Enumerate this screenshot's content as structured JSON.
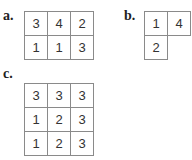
{
  "panels": [
    {
      "label": "a.",
      "rows": [
        [
          "3",
          "4",
          "2"
        ],
        [
          "1",
          "1",
          "3"
        ]
      ]
    },
    {
      "label": "b.",
      "rows": [
        [
          "1",
          "4"
        ],
        [
          "2",
          ""
        ]
      ]
    },
    {
      "label": "c.",
      "rows": [
        [
          "3",
          "3",
          "3"
        ],
        [
          "1",
          "2",
          "3"
        ],
        [
          "1",
          "2",
          "3"
        ]
      ]
    }
  ]
}
